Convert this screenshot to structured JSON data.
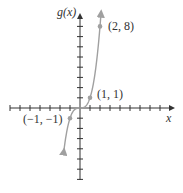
{
  "chart_data": {
    "type": "line",
    "title": "",
    "xlabel": "x",
    "ylabel": "g(x)",
    "function": "g(x) = x^3",
    "x": [
      -1.5,
      -1.25,
      -1,
      -0.75,
      -0.5,
      -0.25,
      0,
      0.25,
      0.5,
      0.75,
      1,
      1.25,
      1.5,
      1.75,
      2,
      2.1
    ],
    "y": [
      -3.375,
      -1.953,
      -1,
      -0.422,
      -0.125,
      -0.016,
      0,
      0.016,
      0.125,
      0.422,
      1,
      1.953,
      3.375,
      5.359,
      8,
      9.26
    ],
    "labeled_points": [
      {
        "x": -1,
        "y": -1,
        "label": "(-1, -1)"
      },
      {
        "x": 1,
        "y": 1,
        "label": "(1, 1)"
      },
      {
        "x": 2,
        "y": 8,
        "label": "(2, 8)"
      }
    ],
    "xlim": [
      -7,
      9
    ],
    "ylim": [
      -7,
      9
    ],
    "grid": false,
    "legend": null,
    "colors": {
      "curve": "#a0a0a0",
      "axis": "#333333",
      "point": "#a0a0a0"
    }
  },
  "labels": {
    "y_axis": "g(x)",
    "x_axis": "x",
    "p1": "(2, 8)",
    "p2": "(1, 1)",
    "p3": "(−1, −1)"
  }
}
